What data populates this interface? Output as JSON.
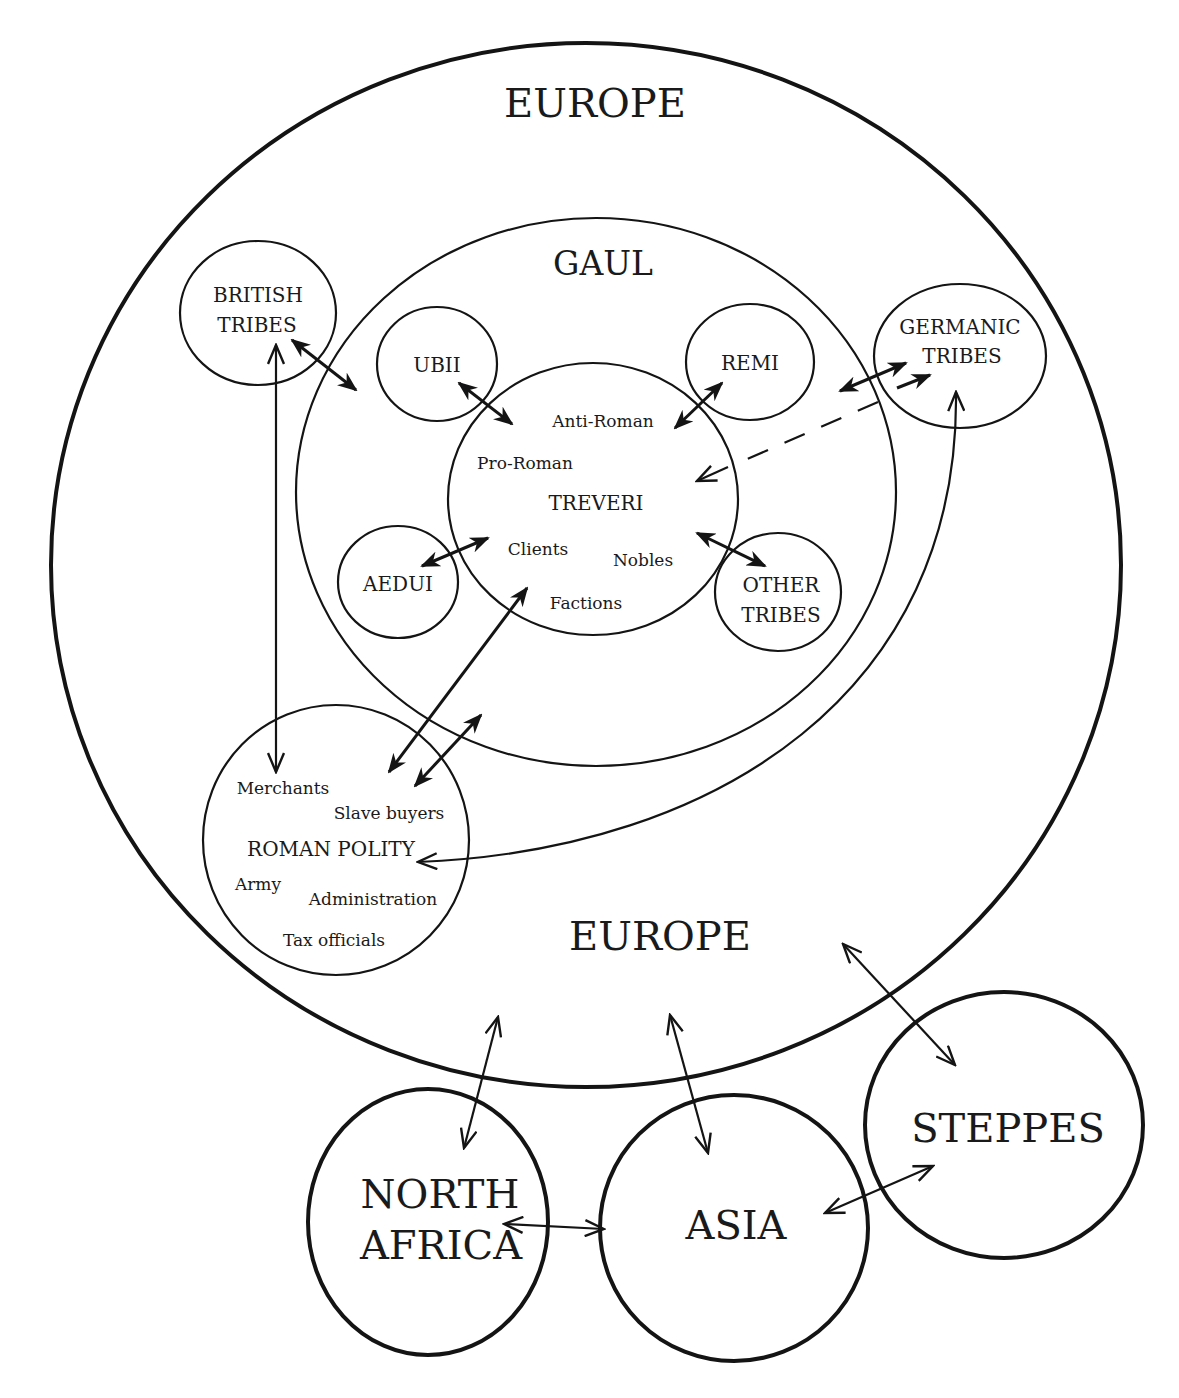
{
  "diagram": {
    "outer_region": {
      "label_top": "EUROPE",
      "label_bottom": "EUROPE"
    },
    "gaul": {
      "label": "GAUL"
    },
    "treveri": {
      "label": "TREVERI",
      "sub_labels": {
        "anti_roman": "Anti-Roman",
        "pro_roman": "Pro-Roman",
        "clients": "Clients",
        "nobles": "Nobles",
        "factions": "Factions"
      }
    },
    "gallic_tribes": {
      "ubii": "UBII",
      "remi": "REMI",
      "aedui": "AEDUI",
      "other_tribes": {
        "line1": "OTHER",
        "line2": "TRIBES"
      }
    },
    "british_tribes": {
      "line1": "BRITISH",
      "line2": "TRIBES"
    },
    "germanic_tribes": {
      "line1": "GERMANIC",
      "line2": "TRIBES"
    },
    "roman_polity": {
      "label": "ROMAN POLITY",
      "sub_labels": {
        "merchants": "Merchants",
        "slave_buyers": "Slave buyers",
        "army": "Army",
        "administration": "Administration",
        "tax_officials": "Tax officials"
      }
    },
    "external_regions": {
      "north_africa": {
        "line1": "NORTH",
        "line2": "AFRICA"
      },
      "asia": "ASIA",
      "steppes": "STEPPES"
    },
    "connections": [
      {
        "from": "BRITISH TRIBES",
        "to": "GAUL",
        "type": "two-way"
      },
      {
        "from": "BRITISH TRIBES",
        "to": "ROMAN POLITY",
        "type": "two-way"
      },
      {
        "from": "UBII",
        "to": "TREVERI",
        "type": "two-way"
      },
      {
        "from": "REMI",
        "to": "TREVERI",
        "type": "two-way"
      },
      {
        "from": "AEDUI",
        "to": "TREVERI",
        "type": "two-way"
      },
      {
        "from": "OTHER TRIBES",
        "to": "TREVERI",
        "type": "two-way"
      },
      {
        "from": "GERMANIC TRIBES",
        "to": "GAUL",
        "type": "two-way"
      },
      {
        "from": "GERMANIC TRIBES",
        "to": "TREVERI",
        "type": "dashed one-way"
      },
      {
        "from": "ROMAN POLITY",
        "to": "TREVERI",
        "type": "two-way"
      },
      {
        "from": "ROMAN POLITY",
        "to": "GAUL",
        "type": "two-way"
      },
      {
        "from": "ROMAN POLITY",
        "to": "GERMANIC TRIBES",
        "type": "two-way curved"
      },
      {
        "from": "EUROPE",
        "to": "NORTH AFRICA",
        "type": "two-way"
      },
      {
        "from": "EUROPE",
        "to": "ASIA",
        "type": "two-way"
      },
      {
        "from": "EUROPE",
        "to": "STEPPES",
        "type": "two-way"
      },
      {
        "from": "NORTH AFRICA",
        "to": "ASIA",
        "type": "two-way"
      },
      {
        "from": "ASIA",
        "to": "STEPPES",
        "type": "two-way"
      }
    ]
  }
}
